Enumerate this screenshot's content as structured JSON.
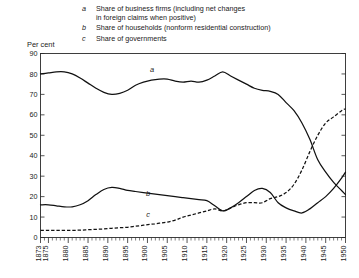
{
  "legend": {
    "entries": [
      {
        "key": "a",
        "text": "Share of business firms (including net changes\nin foreign claims when positive)"
      },
      {
        "key": "b",
        "text": "Share of households (nonform residential construction)"
      },
      {
        "key": "c",
        "text": "Share of governments"
      }
    ]
  },
  "axis": {
    "ylabel": "Per cent"
  },
  "curve_labels": [
    {
      "text": "a",
      "x": 152,
      "y": 72
    },
    {
      "text": "b",
      "x": 148,
      "y": 196
    },
    {
      "text": "c",
      "x": 148,
      "y": 217
    }
  ],
  "chart_data": {
    "type": "line",
    "title": "",
    "xlabel": "",
    "ylabel": "Per cent",
    "xlim": [
      1873,
      1950
    ],
    "ylim": [
      0,
      90
    ],
    "ytick_step": 10,
    "yticks": [
      0,
      10,
      20,
      30,
      40,
      50,
      60,
      70,
      80,
      90
    ],
    "xticks": [
      1873,
      1875,
      1880,
      1885,
      1890,
      1895,
      1900,
      1905,
      1910,
      1915,
      1920,
      1925,
      1930,
      1935,
      1940,
      1945,
      1950
    ],
    "xtick_minor_step": 1,
    "grid": false,
    "legend_position": "top",
    "series": [
      {
        "name": "a",
        "label": "Share of business firms (including net changes in foreign claims when positive)",
        "style": "solid",
        "x": [
          1873,
          1875,
          1877,
          1879,
          1881,
          1883,
          1885,
          1887,
          1889,
          1891,
          1893,
          1895,
          1897,
          1899,
          1901,
          1903,
          1905,
          1907,
          1909,
          1911,
          1913,
          1915,
          1917,
          1919,
          1921,
          1923,
          1925,
          1927,
          1929,
          1931,
          1933,
          1935,
          1937,
          1939,
          1941,
          1943,
          1945,
          1947,
          1949,
          1950
        ],
        "values": [
          80,
          80.5,
          81,
          81,
          80,
          78,
          75.5,
          73,
          71,
          70,
          70.5,
          72,
          74.5,
          76,
          77,
          77.5,
          77.5,
          76.5,
          76,
          76.5,
          76,
          77,
          79,
          81,
          79,
          77,
          75,
          73,
          72,
          71.5,
          70,
          66,
          62,
          56,
          48,
          38,
          32,
          27,
          23,
          21
        ]
      },
      {
        "name": "b",
        "label": "Share of households (nonfarm residential construction)",
        "style": "solid",
        "x": [
          1873,
          1875,
          1877,
          1879,
          1881,
          1883,
          1885,
          1887,
          1889,
          1891,
          1893,
          1895,
          1897,
          1899,
          1901,
          1903,
          1905,
          1907,
          1909,
          1911,
          1913,
          1915,
          1917,
          1919,
          1921,
          1923,
          1925,
          1927,
          1929,
          1931,
          1933,
          1935,
          1937,
          1939,
          1941,
          1943,
          1945,
          1947,
          1949,
          1950
        ],
        "values": [
          16,
          16,
          15.5,
          15,
          15,
          16,
          18,
          21,
          23.5,
          24.5,
          24,
          23,
          22.5,
          22,
          21.5,
          21,
          20.5,
          20,
          19.5,
          19,
          18.5,
          18,
          15.5,
          13,
          14.5,
          17,
          20,
          23,
          24,
          22,
          17,
          14.5,
          13,
          12,
          14,
          17,
          20,
          24,
          29,
          32
        ]
      },
      {
        "name": "c",
        "label": "Share of governments",
        "style": "dashed",
        "x": [
          1873,
          1875,
          1877,
          1879,
          1881,
          1883,
          1885,
          1887,
          1889,
          1891,
          1893,
          1895,
          1897,
          1899,
          1901,
          1903,
          1905,
          1907,
          1909,
          1911,
          1913,
          1915,
          1917,
          1919,
          1921,
          1923,
          1925,
          1927,
          1929,
          1931,
          1933,
          1935,
          1937,
          1939,
          1941,
          1943,
          1945,
          1947,
          1949,
          1950
        ],
        "values": [
          3.5,
          3.5,
          3.5,
          3.5,
          3.5,
          3.6,
          3.8,
          4,
          4.2,
          4.5,
          4.8,
          5,
          5.5,
          6,
          6.5,
          7,
          7.5,
          8.5,
          10,
          11,
          12,
          13,
          14,
          13,
          14.5,
          16,
          17,
          17,
          17,
          19,
          20,
          22,
          26,
          33,
          42,
          50,
          56,
          59,
          62,
          63
        ]
      }
    ]
  }
}
